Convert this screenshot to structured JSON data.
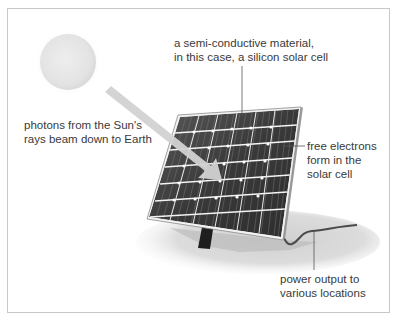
{
  "diagram": {
    "labels": {
      "semiconductor": [
        "a semi-conductive material,",
        "in this case, a silicon solar cell"
      ],
      "photons": [
        "photons from the Sun's",
        "rays beam down to Earth"
      ],
      "electrons": [
        "free electrons",
        "form in the",
        "solar cell"
      ],
      "power": [
        "power output to",
        "various locations"
      ]
    },
    "elements": {
      "sun": "sun",
      "light_beam": "photon-beam-arrow",
      "panel": "solar-panel",
      "stand": "panel-stand",
      "cable": "power-cable",
      "shadow": "ground-shadow"
    },
    "colors": {
      "frame_border": "#c8c8c8",
      "sun_fill": "#e6e6e6",
      "beam": "#d4d4d4",
      "panel_cells": "#3c3c3c",
      "panel_frame": "#f0f0f0",
      "ground": "#d8d8d8",
      "text": "#3a3a3a",
      "leader_lines": "#555555"
    }
  }
}
